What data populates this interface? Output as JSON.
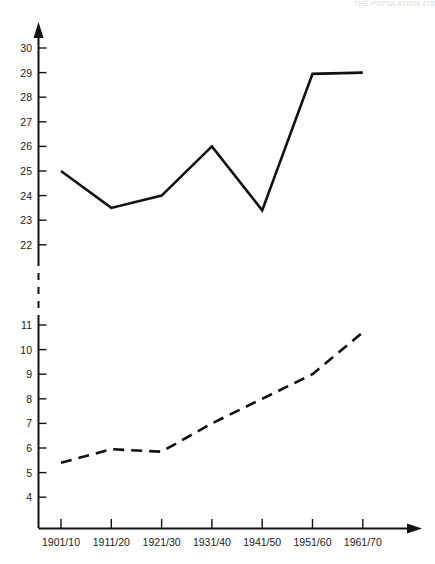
{
  "header": {
    "running_text": "THE POPULATION  275"
  },
  "chart_data": {
    "type": "line",
    "title": "",
    "subtitle": "",
    "xlabel": "",
    "ylabel": "",
    "grid": false,
    "legend_position": "none",
    "axis_break": true,
    "categories": [
      "1901/10",
      "1911/20",
      "1921/30",
      "1931/40",
      "1941/50",
      "1951/60",
      "1961/70"
    ],
    "upper_axis": {
      "ticks": [
        22,
        23,
        24,
        25,
        26,
        27,
        28,
        29,
        30
      ],
      "ylim": [
        22,
        30.6
      ]
    },
    "lower_axis": {
      "ticks": [
        4,
        5,
        6,
        7,
        8,
        9,
        10,
        11
      ],
      "ylim": [
        3.4,
        11.4
      ]
    },
    "series": [
      {
        "name": "upper-series",
        "style": "solid",
        "axis": "upper",
        "values": [
          25.0,
          23.5,
          24.0,
          26.0,
          23.4,
          28.95,
          29.0
        ]
      },
      {
        "name": "lower-series",
        "style": "dashed",
        "axis": "lower",
        "values": [
          5.4,
          5.95,
          5.85,
          7.0,
          8.0,
          9.0,
          10.7
        ]
      }
    ]
  }
}
